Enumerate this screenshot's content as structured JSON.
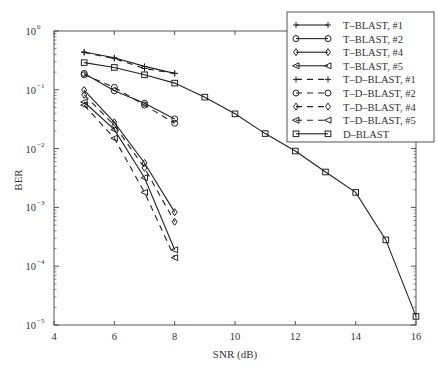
{
  "chart_data": {
    "type": "line",
    "title": "",
    "xlabel": "SNR (dB)",
    "ylabel": "BER",
    "xlim": [
      4,
      16
    ],
    "ylim": [
      1e-05,
      1
    ],
    "yscale": "log",
    "grid": false,
    "legend_position": "upper right",
    "x_ticks": [
      4,
      6,
      8,
      10,
      12,
      14,
      16
    ],
    "y_ticks": [
      {
        "value": 1,
        "label_base": "10",
        "label_exp": "0"
      },
      {
        "value": 0.1,
        "label_base": "10",
        "label_exp": "−1"
      },
      {
        "value": 0.01,
        "label_base": "10",
        "label_exp": "−2"
      },
      {
        "value": 0.001,
        "label_base": "10",
        "label_exp": "−3"
      },
      {
        "value": 0.0001,
        "label_base": "10",
        "label_exp": "−4"
      },
      {
        "value": 1e-05,
        "label_base": "10",
        "label_exp": "−5"
      }
    ],
    "series": [
      {
        "name": "T–BLAST, #1",
        "marker": "plus",
        "dash": false,
        "x": [
          5,
          6,
          7,
          8
        ],
        "values": [
          0.44,
          0.35,
          0.25,
          0.19
        ]
      },
      {
        "name": "T–BLAST, #2",
        "marker": "circle",
        "dash": false,
        "x": [
          5,
          6,
          7,
          8
        ],
        "values": [
          0.19,
          0.096,
          0.059,
          0.032
        ]
      },
      {
        "name": "T–BLAST, #4",
        "marker": "diamond",
        "dash": false,
        "x": [
          5,
          6,
          7,
          8
        ],
        "values": [
          0.099,
          0.028,
          0.0057,
          0.00083
        ]
      },
      {
        "name": "T–BLAST, #5",
        "marker": "triangle-left",
        "dash": false,
        "x": [
          5,
          6,
          7,
          8
        ],
        "values": [
          0.062,
          0.021,
          0.0032,
          0.00019
        ]
      },
      {
        "name": "T–D–BLAST, #1",
        "marker": "plus",
        "dash": true,
        "x": [
          5,
          6,
          7,
          8
        ],
        "values": [
          0.43,
          0.34,
          0.23,
          0.19
        ]
      },
      {
        "name": "T–D–BLAST, #2",
        "marker": "circle",
        "dash": true,
        "x": [
          5,
          6,
          7,
          8
        ],
        "values": [
          0.18,
          0.11,
          0.055,
          0.027
        ]
      },
      {
        "name": "T–D–BLAST, #4",
        "marker": "diamond",
        "dash": true,
        "x": [
          5,
          6,
          7,
          8
        ],
        "values": [
          0.082,
          0.025,
          0.0047,
          0.00057
        ]
      },
      {
        "name": "T–D–BLAST, #5",
        "marker": "triangle-left",
        "dash": true,
        "x": [
          5,
          6,
          7,
          8
        ],
        "values": [
          0.055,
          0.015,
          0.0018,
          0.00014
        ]
      },
      {
        "name": "D–BLAST",
        "marker": "square",
        "dash": false,
        "x": [
          5,
          6,
          7,
          8,
          9,
          10,
          11,
          12,
          13,
          14,
          15,
          16
        ],
        "values": [
          0.29,
          0.24,
          0.18,
          0.13,
          0.075,
          0.039,
          0.018,
          0.0091,
          0.004,
          0.0018,
          0.00028,
          1.4e-05
        ]
      }
    ]
  },
  "colors": {
    "line": "#222222",
    "axis": "#555555",
    "background": "#ffffff"
  }
}
